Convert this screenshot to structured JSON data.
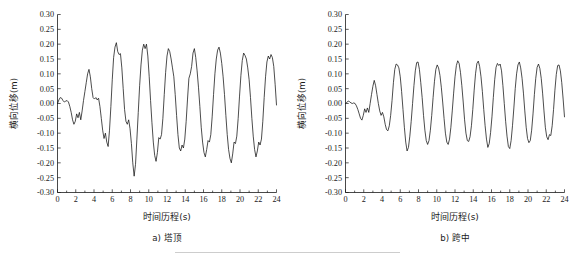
{
  "figure": {
    "background_color": "#ffffff",
    "line_color": "#111111",
    "axis_color": "#1a1a1a"
  },
  "chart_data": [
    {
      "type": "line",
      "panel_id": "a",
      "caption": "a) 塔顶",
      "title": "",
      "xlabel": "时间历程(s)",
      "ylabel": "横向位移(m)",
      "xlim": [
        0,
        24
      ],
      "ylim": [
        -0.3,
        0.3
      ],
      "xticks": [
        0,
        2,
        4,
        6,
        8,
        10,
        12,
        14,
        16,
        18,
        20,
        22,
        24
      ],
      "xtick_labels": [
        "0",
        "2",
        "4",
        "6",
        "8",
        "10",
        "12",
        "14",
        "16",
        "18",
        "20",
        "22",
        "24"
      ],
      "yticks": [
        -0.3,
        -0.25,
        -0.2,
        -0.15,
        -0.1,
        -0.05,
        0.0,
        0.05,
        0.1,
        0.15,
        0.2,
        0.25,
        0.3
      ],
      "ytick_labels": [
        "-0.30",
        "-0.25",
        "-0.20",
        "-0.15",
        "-0.10",
        "-0.05",
        "0.00",
        "0.05",
        "0.10",
        "0.15",
        "0.20",
        "0.25",
        "0.30"
      ],
      "grid": false,
      "legend": null,
      "series": [
        {
          "name": "塔顶横向位移",
          "x": [
            0.0,
            0.15,
            0.3,
            0.45,
            0.6,
            0.75,
            0.9,
            1.05,
            1.2,
            1.35,
            1.5,
            1.65,
            1.8,
            1.95,
            2.1,
            2.25,
            2.4,
            2.55,
            2.7,
            2.85,
            3.0,
            3.15,
            3.3,
            3.45,
            3.6,
            3.75,
            3.9,
            4.05,
            4.2,
            4.35,
            4.5,
            4.65,
            4.8,
            4.95,
            5.1,
            5.25,
            5.4,
            5.55,
            5.7,
            5.85,
            6.0,
            6.15,
            6.3,
            6.45,
            6.6,
            6.75,
            6.9,
            7.05,
            7.2,
            7.35,
            7.5,
            7.65,
            7.8,
            7.95,
            8.1,
            8.25,
            8.4,
            8.55,
            8.7,
            8.85,
            9.0,
            9.15,
            9.3,
            9.45,
            9.6,
            9.75,
            9.9,
            10.05,
            10.2,
            10.35,
            10.5,
            10.65,
            10.8,
            10.95,
            11.1,
            11.25,
            11.4,
            11.55,
            11.7,
            11.85,
            12.0,
            12.15,
            12.3,
            12.45,
            12.6,
            12.75,
            12.9,
            13.05,
            13.2,
            13.35,
            13.5,
            13.65,
            13.8,
            13.95,
            14.1,
            14.25,
            14.4,
            14.55,
            14.7,
            14.85,
            15.0,
            15.15,
            15.3,
            15.45,
            15.6,
            15.75,
            15.9,
            16.05,
            16.2,
            16.35,
            16.5,
            16.65,
            16.8,
            16.95,
            17.1,
            17.25,
            17.4,
            17.55,
            17.7,
            17.85,
            18.0,
            18.15,
            18.3,
            18.45,
            18.6,
            18.75,
            18.9,
            19.05,
            19.2,
            19.35,
            19.5,
            19.65,
            19.8,
            19.95,
            20.1,
            20.25,
            20.4,
            20.55,
            20.7,
            20.85,
            21.0,
            21.15,
            21.3,
            21.45,
            21.6,
            21.75,
            21.9,
            22.05,
            22.2,
            22.35,
            22.5,
            22.65,
            22.8,
            22.95,
            23.1,
            23.25,
            23.4,
            23.55,
            23.7,
            23.85,
            24.0
          ],
          "y": [
            0.0,
            0.012,
            0.02,
            0.018,
            0.01,
            0.005,
            0.008,
            0.01,
            0.005,
            -0.01,
            -0.03,
            -0.055,
            -0.07,
            -0.06,
            -0.035,
            -0.048,
            -0.03,
            -0.055,
            -0.025,
            0.01,
            0.04,
            0.07,
            0.1,
            0.115,
            0.09,
            0.05,
            0.02,
            0.015,
            0.02,
            0.012,
            0.018,
            -0.01,
            -0.05,
            -0.09,
            -0.118,
            -0.1,
            -0.13,
            -0.145,
            -0.09,
            -0.01,
            0.08,
            0.155,
            0.19,
            0.205,
            0.175,
            0.165,
            0.168,
            0.12,
            0.05,
            -0.02,
            -0.06,
            -0.07,
            -0.055,
            -0.085,
            -0.135,
            -0.2,
            -0.245,
            -0.205,
            -0.12,
            -0.03,
            0.06,
            0.13,
            0.18,
            0.2,
            0.185,
            0.2,
            0.16,
            0.09,
            0.01,
            -0.065,
            -0.13,
            -0.175,
            -0.195,
            -0.165,
            -0.115,
            -0.12,
            -0.105,
            -0.05,
            0.03,
            0.105,
            0.16,
            0.185,
            0.175,
            0.15,
            0.12,
            0.09,
            0.03,
            -0.04,
            -0.105,
            -0.15,
            -0.16,
            -0.14,
            -0.15,
            -0.12,
            -0.06,
            0.015,
            0.085,
            0.1,
            0.125,
            0.17,
            0.185,
            0.155,
            0.11,
            0.055,
            -0.01,
            -0.08,
            -0.13,
            -0.165,
            -0.18,
            -0.155,
            -0.125,
            -0.13,
            -0.105,
            -0.045,
            0.03,
            0.1,
            0.15,
            0.18,
            0.19,
            0.17,
            0.135,
            0.09,
            0.03,
            -0.04,
            -0.105,
            -0.155,
            -0.185,
            -0.2,
            -0.17,
            -0.13,
            -0.135,
            -0.11,
            -0.05,
            0.025,
            0.095,
            0.145,
            0.17,
            0.162,
            0.15,
            0.12,
            0.08,
            0.02,
            -0.05,
            -0.11,
            -0.155,
            -0.18,
            -0.16,
            -0.13,
            -0.14,
            -0.12,
            -0.06,
            0.02,
            0.09,
            0.14,
            0.16,
            0.15,
            0.165,
            0.155,
            0.125,
            0.065,
            -0.005,
            -0.07,
            -0.125,
            -0.158,
            -0.15,
            -0.135,
            -0.145,
            -0.125,
            -0.065,
            0.01,
            0.08,
            0.13,
            0.152,
            0.13,
            0.115,
            0.145,
            0.155,
            0.125,
            0.105
          ]
        }
      ]
    },
    {
      "type": "line",
      "panel_id": "b",
      "caption": "b) 跨中",
      "title": "",
      "xlabel": "时间历程(s)",
      "ylabel": "横向位移(m)",
      "xlim": [
        0,
        24
      ],
      "ylim": [
        -0.3,
        0.3
      ],
      "xticks": [
        0,
        2,
        4,
        6,
        8,
        10,
        12,
        14,
        16,
        18,
        20,
        22,
        24
      ],
      "xtick_labels": [
        "0",
        "2",
        "4",
        "6",
        "8",
        "10",
        "12",
        "14",
        "16",
        "18",
        "20",
        "22",
        "24"
      ],
      "yticks": [
        -0.3,
        -0.25,
        -0.2,
        -0.15,
        -0.1,
        -0.05,
        0.0,
        0.05,
        0.1,
        0.15,
        0.2,
        0.25,
        0.3
      ],
      "ytick_labels": [
        "-0.30",
        "-0.25",
        "-0.20",
        "-0.15",
        "-0.10",
        "-0.05",
        "0.00",
        "0.05",
        "0.10",
        "0.15",
        "0.20",
        "0.25",
        "0.30"
      ],
      "grid": false,
      "legend": null,
      "series": [
        {
          "name": "跨中横向位移",
          "x": [
            0.0,
            0.15,
            0.3,
            0.45,
            0.6,
            0.75,
            0.9,
            1.05,
            1.2,
            1.35,
            1.5,
            1.65,
            1.8,
            1.95,
            2.1,
            2.25,
            2.4,
            2.55,
            2.7,
            2.85,
            3.0,
            3.15,
            3.3,
            3.45,
            3.6,
            3.75,
            3.9,
            4.05,
            4.2,
            4.35,
            4.5,
            4.65,
            4.8,
            4.95,
            5.1,
            5.25,
            5.4,
            5.55,
            5.7,
            5.85,
            6.0,
            6.15,
            6.3,
            6.45,
            6.6,
            6.75,
            6.9,
            7.05,
            7.2,
            7.35,
            7.5,
            7.65,
            7.8,
            7.95,
            8.1,
            8.25,
            8.4,
            8.55,
            8.7,
            8.85,
            9.0,
            9.15,
            9.3,
            9.45,
            9.6,
            9.75,
            9.9,
            10.05,
            10.2,
            10.35,
            10.5,
            10.65,
            10.8,
            10.95,
            11.1,
            11.25,
            11.4,
            11.55,
            11.7,
            11.85,
            12.0,
            12.15,
            12.3,
            12.45,
            12.6,
            12.75,
            12.9,
            13.05,
            13.2,
            13.35,
            13.5,
            13.65,
            13.8,
            13.95,
            14.1,
            14.25,
            14.4,
            14.55,
            14.7,
            14.85,
            15.0,
            15.15,
            15.3,
            15.45,
            15.6,
            15.75,
            15.9,
            16.05,
            16.2,
            16.35,
            16.5,
            16.65,
            16.8,
            16.95,
            17.1,
            17.25,
            17.4,
            17.55,
            17.7,
            17.85,
            18.0,
            18.15,
            18.3,
            18.45,
            18.6,
            18.75,
            18.9,
            19.05,
            19.2,
            19.35,
            19.5,
            19.65,
            19.8,
            19.95,
            20.1,
            20.25,
            20.4,
            20.55,
            20.7,
            20.85,
            21.0,
            21.15,
            21.3,
            21.45,
            21.6,
            21.75,
            21.9,
            22.05,
            22.2,
            22.35,
            22.5,
            22.65,
            22.8,
            22.95,
            23.1,
            23.25,
            23.4,
            23.55,
            23.7,
            23.85,
            24.0
          ],
          "y": [
            0.0,
            0.004,
            0.008,
            0.006,
            0.002,
            0.0,
            0.002,
            0.0,
            -0.008,
            -0.02,
            -0.035,
            -0.05,
            -0.056,
            -0.04,
            -0.018,
            -0.03,
            -0.015,
            -0.03,
            0.0,
            0.03,
            0.058,
            0.078,
            0.06,
            0.03,
            0.0,
            -0.025,
            -0.04,
            -0.03,
            -0.045,
            -0.07,
            -0.088,
            -0.092,
            -0.075,
            -0.04,
            0.01,
            0.07,
            0.115,
            0.133,
            0.13,
            0.12,
            0.09,
            0.04,
            -0.02,
            -0.08,
            -0.13,
            -0.16,
            -0.148,
            -0.11,
            -0.06,
            0.0,
            0.06,
            0.11,
            0.138,
            0.14,
            0.115,
            0.07,
            0.02,
            -0.04,
            -0.09,
            -0.125,
            -0.138,
            -0.125,
            -0.09,
            -0.04,
            0.02,
            0.075,
            0.115,
            0.13,
            0.12,
            0.095,
            0.055,
            0.005,
            -0.05,
            -0.1,
            -0.13,
            -0.138,
            -0.12,
            -0.08,
            -0.025,
            0.035,
            0.09,
            0.128,
            0.144,
            0.135,
            0.105,
            0.06,
            0.005,
            -0.055,
            -0.1,
            -0.125,
            -0.128,
            -0.112,
            -0.075,
            -0.02,
            0.045,
            0.1,
            0.135,
            0.143,
            0.125,
            0.09,
            0.04,
            -0.02,
            -0.075,
            -0.12,
            -0.148,
            -0.135,
            -0.098,
            -0.045,
            0.02,
            0.08,
            0.122,
            0.135,
            0.128,
            0.133,
            0.11,
            0.06,
            0.0,
            -0.06,
            -0.11,
            -0.145,
            -0.152,
            -0.125,
            -0.075,
            -0.015,
            0.05,
            0.1,
            0.13,
            0.14,
            0.12,
            0.085,
            0.035,
            -0.025,
            -0.08,
            -0.118,
            -0.132,
            -0.125,
            -0.09,
            -0.035,
            0.03,
            0.085,
            0.122,
            0.133,
            0.118,
            0.085,
            0.035,
            -0.025,
            -0.08,
            -0.112,
            -0.122,
            -0.105,
            -0.108,
            -0.075,
            -0.02,
            0.045,
            0.098,
            0.128,
            0.13,
            0.11,
            0.07,
            0.015,
            -0.045,
            -0.09,
            -0.102
          ]
        }
      ]
    }
  ]
}
